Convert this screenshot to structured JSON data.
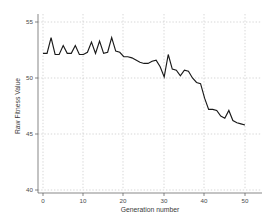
{
  "chart_data": {
    "type": "line",
    "title": "",
    "xlabel": "Generation number",
    "ylabel": "Raw Fitness Value",
    "xlim": [
      -1.5,
      52
    ],
    "ylim": [
      39.0,
      55.8
    ],
    "xticks": [
      0,
      10,
      20,
      30,
      40,
      50
    ],
    "xticklabels": [
      "0",
      "10",
      "20",
      "30",
      "40",
      "50"
    ],
    "yticks": [
      40,
      45,
      50,
      55
    ],
    "yticklabels": [
      "40",
      "45",
      "50",
      "55"
    ],
    "grid": true,
    "legend": false,
    "line_color": "#1a1a1a",
    "grid_color": "#bdbdbd",
    "background_color": "#ffffff",
    "series": [
      {
        "name": "Raw Fitness Value",
        "x": [
          0,
          1,
          2,
          3,
          4,
          5,
          6,
          7,
          8,
          9,
          10,
          11,
          12,
          13,
          14,
          15,
          16,
          17,
          18,
          19,
          20,
          21,
          22,
          23,
          24,
          25,
          26,
          27,
          28,
          29,
          30,
          31,
          32,
          33,
          34,
          35,
          36,
          37,
          38,
          39,
          40,
          41,
          42,
          43,
          44,
          45,
          46,
          47,
          48,
          49,
          50
        ],
        "values": [
          52.2,
          52.2,
          53.6,
          52.1,
          52.1,
          52.9,
          52.2,
          52.2,
          52.9,
          52.1,
          52.1,
          52.3,
          53.2,
          52.2,
          53.3,
          52.2,
          52.3,
          53.6,
          52.4,
          52.3,
          51.9,
          51.9,
          51.8,
          51.6,
          51.4,
          51.3,
          51.3,
          51.5,
          51.6,
          51.0,
          50.1,
          52.1,
          50.8,
          50.7,
          50.2,
          50.7,
          50.6,
          50.0,
          49.6,
          49.5,
          48.2,
          47.2,
          47.2,
          47.1,
          46.6,
          46.4,
          47.1,
          46.2,
          46.0,
          45.9,
          45.8
        ]
      }
    ]
  },
  "axis": {
    "x_title": "Generation number",
    "y_title": "Raw Fitness Value"
  }
}
